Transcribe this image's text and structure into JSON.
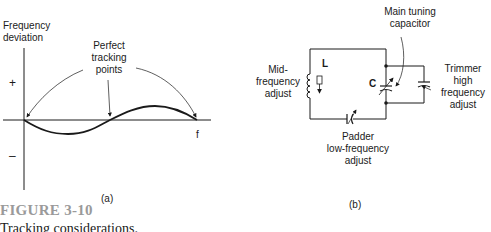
{
  "panel_a": {
    "y_axis_label_line1": "Frequency",
    "y_axis_label_line2": "deviation",
    "x_axis_label": "f",
    "plus_sign": "+",
    "minus_sign": "–",
    "annotation_line1": "Perfect",
    "annotation_line2": "tracking",
    "annotation_line3": "points",
    "panel_label": "(a)"
  },
  "panel_b": {
    "main_cap_line1": "Main tuning",
    "main_cap_line2": "capacitor",
    "inductor_label": "L",
    "capacitor_label": "C",
    "mid_line1": "Mid-",
    "mid_line2": "frequency",
    "mid_line3": "adjust",
    "trimmer_line1": "Trimmer",
    "trimmer_line2": "high",
    "trimmer_line3": "frequency",
    "trimmer_line4": "adjust",
    "padder_line1": "Padder",
    "padder_line2": "low-frequency",
    "padder_line3": "adjust",
    "panel_label": "(b)"
  },
  "caption": {
    "figure_number": "FIGURE 3-10",
    "title": "Tracking considerations."
  }
}
